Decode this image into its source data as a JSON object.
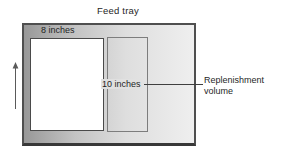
{
  "figure": {
    "title": "Feed tray",
    "paper_width_label": "8 inches",
    "paper_height_label": "10 inches",
    "callout": {
      "line1": "Replenishment",
      "line2": "volume"
    },
    "icons": {
      "up_arrow": "up-arrow-icon"
    },
    "colors": {
      "tray_fill_left": "#989898",
      "tray_fill_right": "#efefef",
      "tray_border": "#4f4f4f",
      "paper_fill": "#ffffff",
      "paper_border": "#4a4a4a",
      "replenishment_border": "#7d7d7d",
      "connector_line": "#3f3f3f",
      "text": "#1f1f1f",
      "background": "#ffffff"
    }
  }
}
